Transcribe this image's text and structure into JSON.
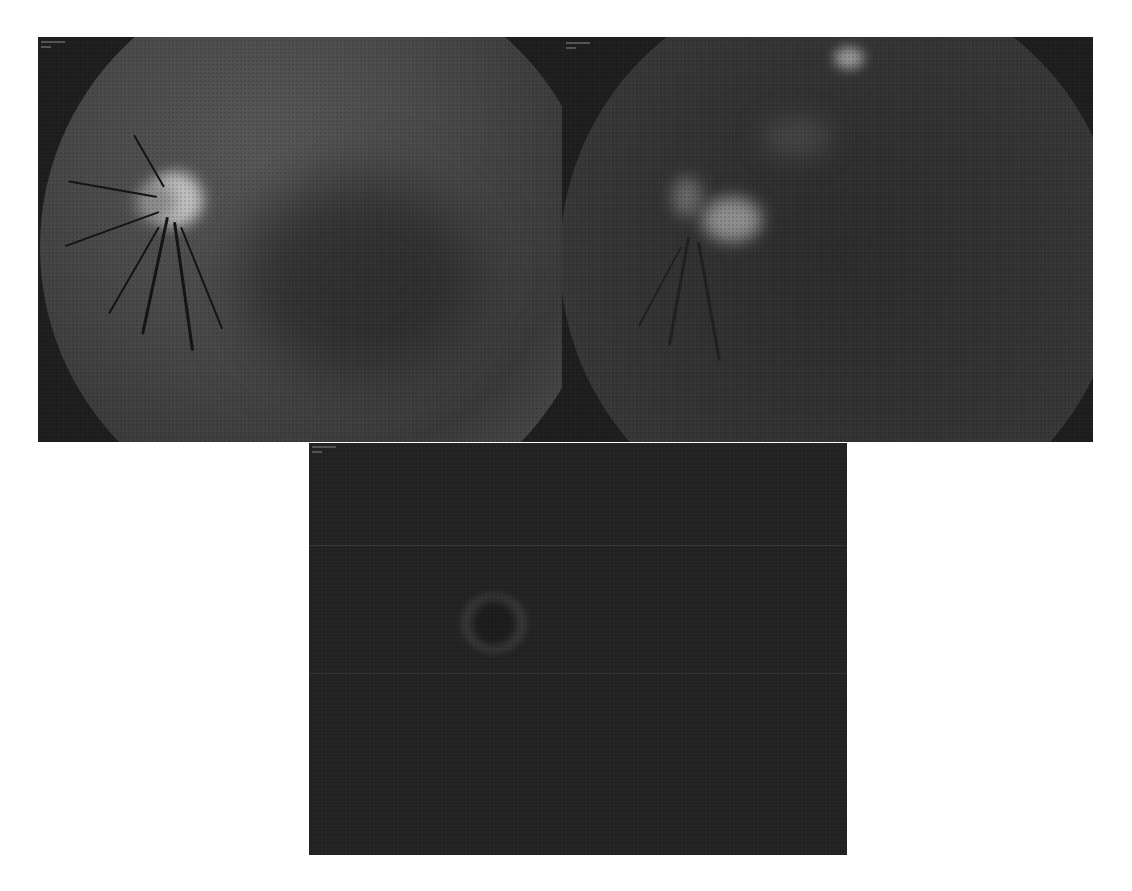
{
  "figure": {
    "panels": [
      {
        "id": "top-left",
        "kind": "fundus-angiogram",
        "overlay_label": "illegible",
        "colors": {
          "background": "#1e1e1e",
          "fundus": "#4a4a4a",
          "optic_disc": "#b8b8b8"
        }
      },
      {
        "id": "top-right",
        "kind": "fundus-angiogram",
        "overlay_label": "illegible",
        "colors": {
          "background": "#1e1e1e",
          "fundus": "#3a3a3a",
          "lesion": "#8a8a8a"
        }
      },
      {
        "id": "bottom",
        "kind": "fundus-angiogram-late",
        "overlay_label": "illegible",
        "colors": {
          "background": "#232323",
          "ring": "#3c3c3c"
        }
      }
    ]
  }
}
